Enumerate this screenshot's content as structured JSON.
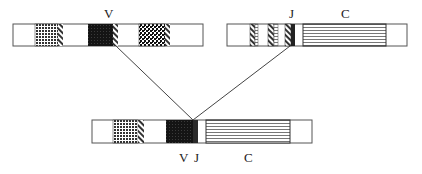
{
  "diagram": {
    "top_left_bar": {
      "label": "V",
      "segments": [
        {
          "type": "dotted",
          "x": 35,
          "w": 23
        },
        {
          "type": "hatch",
          "x": 58,
          "w": 5
        },
        {
          "type": "black",
          "x": 88,
          "w": 25
        },
        {
          "type": "hatch",
          "x": 113,
          "w": 5
        },
        {
          "type": "grid",
          "x": 139,
          "w": 26
        },
        {
          "type": "hatch",
          "x": 165,
          "w": 5
        }
      ]
    },
    "top_right_bar": {
      "labels": [
        "J",
        "C"
      ],
      "segments": [
        {
          "type": "hatch",
          "x": 250,
          "w": 5
        },
        {
          "type": "gray",
          "x": 255,
          "w": 3
        },
        {
          "type": "hatch",
          "x": 268,
          "w": 6
        },
        {
          "type": "gray",
          "x": 274,
          "w": 4
        },
        {
          "type": "hatch",
          "x": 285,
          "w": 6
        },
        {
          "type": "dark",
          "x": 291,
          "w": 4
        },
        {
          "type": "lines",
          "x": 303,
          "w": 83
        }
      ]
    },
    "bottom_bar": {
      "labels": [
        "V",
        "J",
        "C"
      ],
      "segments": [
        {
          "type": "dotted",
          "x": 113,
          "w": 25
        },
        {
          "type": "hatch",
          "x": 138,
          "w": 6
        },
        {
          "type": "black",
          "x": 166,
          "w": 27
        },
        {
          "type": "dark",
          "x": 193,
          "w": 5
        },
        {
          "type": "lines",
          "x": 206,
          "w": 84
        }
      ]
    },
    "labels": {
      "top_v": "V",
      "top_j": "J",
      "top_c": "C",
      "bottom_v": "V",
      "bottom_j": "J",
      "bottom_c": "C"
    }
  }
}
